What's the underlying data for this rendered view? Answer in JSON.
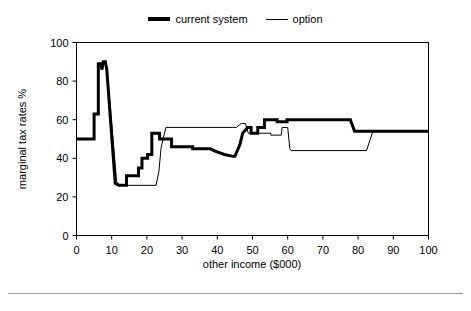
{
  "legend": {
    "position": "top-center",
    "items": [
      {
        "label": "current system",
        "style": "thick",
        "icon": "line-thick-icon"
      },
      {
        "label": "option",
        "style": "thin",
        "icon": "line-thin-icon"
      }
    ]
  },
  "axes": {
    "xlabel": "other income ($000)",
    "ylabel": "marginal tax rates %",
    "xticks": [
      "0",
      "10",
      "20",
      "30",
      "40",
      "50",
      "60",
      "70",
      "80",
      "90",
      "100"
    ],
    "yticks": [
      "0",
      "20",
      "40",
      "60",
      "80",
      "100"
    ]
  },
  "colors": {
    "line": "#000000",
    "frame": "#000000",
    "background": "#ffffff",
    "rule": "#9a9a9a"
  },
  "chart_data": {
    "type": "line",
    "title": "",
    "xlabel": "other income ($000)",
    "ylabel": "marginal tax rates %",
    "xlim": [
      0,
      100
    ],
    "ylim": [
      0,
      100
    ],
    "xticks": [
      0,
      10,
      20,
      30,
      40,
      50,
      60,
      70,
      80,
      90,
      100
    ],
    "yticks": [
      0,
      20,
      40,
      60,
      80,
      100
    ],
    "grid": false,
    "legend_position": "top-center",
    "series": [
      {
        "name": "current system",
        "style": "thick",
        "linewidth": 3,
        "points": [
          [
            0,
            50
          ],
          [
            5.0,
            50
          ],
          [
            5.0,
            63
          ],
          [
            6.2,
            63
          ],
          [
            6.2,
            89
          ],
          [
            7.0,
            89
          ],
          [
            7.2,
            86
          ],
          [
            7.6,
            90
          ],
          [
            8.2,
            90
          ],
          [
            8.6,
            86
          ],
          [
            11.0,
            27
          ],
          [
            12.0,
            26
          ],
          [
            14.2,
            26
          ],
          [
            14.2,
            31
          ],
          [
            17.6,
            31
          ],
          [
            17.6,
            35
          ],
          [
            18.6,
            35
          ],
          [
            18.6,
            40
          ],
          [
            20.2,
            40
          ],
          [
            20.2,
            42
          ],
          [
            21.4,
            42
          ],
          [
            21.4,
            53
          ],
          [
            23.6,
            53
          ],
          [
            23.6,
            50
          ],
          [
            27.0,
            50
          ],
          [
            27.0,
            46
          ],
          [
            33.0,
            46
          ],
          [
            33.0,
            45
          ],
          [
            38.0,
            45
          ],
          [
            39.0,
            44
          ],
          [
            42.0,
            42
          ],
          [
            44.5,
            41
          ],
          [
            45.0,
            41
          ],
          [
            46.4,
            47
          ],
          [
            47.2,
            53
          ],
          [
            48.6,
            56
          ],
          [
            49.6,
            56
          ],
          [
            49.6,
            53
          ],
          [
            51.5,
            53
          ],
          [
            51.5,
            56
          ],
          [
            53.4,
            56
          ],
          [
            53.4,
            60
          ],
          [
            57.0,
            60
          ],
          [
            57.0,
            59
          ],
          [
            59.8,
            59
          ],
          [
            59.8,
            60
          ],
          [
            77.8,
            60
          ],
          [
            79.0,
            54
          ],
          [
            100,
            54
          ]
        ]
      },
      {
        "name": "option",
        "style": "thin",
        "linewidth": 1,
        "points": [
          [
            0,
            50
          ],
          [
            5.0,
            50
          ],
          [
            5.0,
            63
          ],
          [
            6.2,
            63
          ],
          [
            6.2,
            89
          ],
          [
            7.2,
            89
          ],
          [
            7.4,
            86
          ],
          [
            7.8,
            89
          ],
          [
            8.4,
            89
          ],
          [
            8.8,
            84
          ],
          [
            11.4,
            28
          ],
          [
            12.4,
            26
          ],
          [
            22.6,
            26
          ],
          [
            23.4,
            33
          ],
          [
            24.0,
            45
          ],
          [
            24.6,
            50
          ],
          [
            25.4,
            56
          ],
          [
            44.4,
            56
          ],
          [
            45.4,
            56
          ],
          [
            46.8,
            58
          ],
          [
            48.0,
            58
          ],
          [
            48.8,
            53
          ],
          [
            55.2,
            53
          ],
          [
            55.2,
            52
          ],
          [
            58.2,
            52
          ],
          [
            58.4,
            56
          ],
          [
            60.0,
            56
          ],
          [
            60.6,
            45
          ],
          [
            61.0,
            44
          ],
          [
            82.4,
            44
          ],
          [
            84.2,
            54
          ],
          [
            100,
            54
          ]
        ]
      }
    ]
  }
}
